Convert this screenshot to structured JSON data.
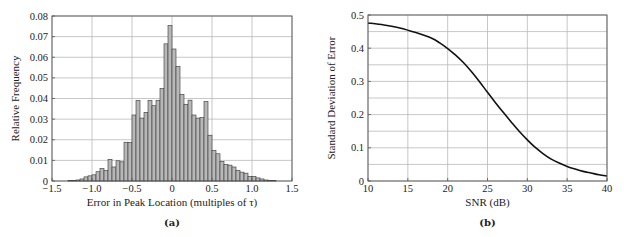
{
  "chart_data": [
    {
      "type": "bar",
      "subtype": "histogram",
      "caption": "(a)",
      "title": "",
      "xlabel": "Error in Peak Location (multiples of τ)",
      "ylabel": "Relative Frequency",
      "xlim": [
        -1.5,
        1.5
      ],
      "ylim": [
        0,
        0.08
      ],
      "xticks": [
        -1.5,
        -1.0,
        -0.5,
        0,
        0.5,
        1.0,
        1.5
      ],
      "xtick_labels": [
        "−1.5",
        "−1.0",
        "−0.5",
        "0",
        "0.5",
        "1.0",
        "1.5"
      ],
      "yticks": [
        0,
        0.01,
        0.02,
        0.03,
        0.04,
        0.05,
        0.06,
        0.07,
        0.08
      ],
      "ytick_labels": [
        "0",
        "0.01",
        "0.02",
        "0.03",
        "0.04",
        "0.05",
        "0.06",
        "0.07",
        "0.08"
      ],
      "grid": true,
      "bin_start": -1.3,
      "bin_width": 0.05,
      "values": [
        0.0002,
        0.0003,
        0.0005,
        0.001,
        0.002,
        0.0025,
        0.003,
        0.0045,
        0.006,
        0.005,
        0.0105,
        0.0068,
        0.0098,
        0.0093,
        0.0188,
        0.0187,
        0.032,
        0.039,
        0.0305,
        0.0333,
        0.039,
        0.0365,
        0.039,
        0.0448,
        0.0665,
        0.0753,
        0.064,
        0.0555,
        0.042,
        0.0372,
        0.0392,
        0.032,
        0.0305,
        0.0307,
        0.0385,
        0.0222,
        0.0148,
        0.0132,
        0.0095,
        0.008,
        0.0077,
        0.0068,
        0.0052,
        0.0043,
        0.0038,
        0.0022,
        0.0022,
        0.0015,
        0.001,
        0.0005,
        0.0003,
        0.0002
      ]
    },
    {
      "type": "line",
      "caption": "(b)",
      "title": "",
      "xlabel": "SNR (dB)",
      "ylabel": "Standard Deviation of Error",
      "xlim": [
        10,
        40
      ],
      "ylim": [
        0,
        0.5
      ],
      "xticks": [
        10,
        15,
        20,
        25,
        30,
        35,
        40
      ],
      "xtick_labels": [
        "10",
        "15",
        "20",
        "25",
        "30",
        "35",
        "40"
      ],
      "yticks": [
        0,
        0.1,
        0.2,
        0.3,
        0.4,
        0.5
      ],
      "ytick_labels": [
        "0",
        "0.1",
        "0.2",
        "0.3",
        "0.4",
        "0.5"
      ],
      "minor_ygrid_step": 0.05,
      "grid": true,
      "series": [
        {
          "name": "Standard Deviation of Error",
          "x": [
            10,
            12,
            14,
            16,
            18,
            19,
            20,
            21,
            22,
            23,
            24,
            25,
            26,
            27,
            28,
            29,
            30,
            31,
            32,
            33,
            34,
            35,
            36,
            37,
            38,
            39,
            40
          ],
          "y": [
            0.476,
            0.47,
            0.461,
            0.447,
            0.43,
            0.416,
            0.399,
            0.379,
            0.356,
            0.329,
            0.299,
            0.267,
            0.236,
            0.206,
            0.177,
            0.149,
            0.124,
            0.101,
            0.082,
            0.066,
            0.054,
            0.044,
            0.036,
            0.029,
            0.024,
            0.019,
            0.015
          ]
        }
      ]
    }
  ]
}
